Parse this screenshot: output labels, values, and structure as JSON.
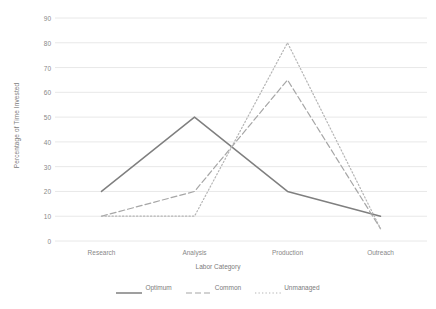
{
  "chart_data": {
    "type": "line",
    "title": "",
    "xlabel": "Labor Category",
    "ylabel": "Percentage of Time Invested",
    "categories": [
      "Research",
      "Analysis",
      "Production",
      "Outreach"
    ],
    "ylim": [
      0,
      90
    ],
    "ytick_labels": [
      "0",
      "10",
      "20",
      "30",
      "40",
      "50",
      "60",
      "70",
      "80",
      "90"
    ],
    "ytick_values": [
      0,
      10,
      20,
      30,
      40,
      50,
      60,
      70,
      80,
      90
    ],
    "grid": true,
    "grid_axis": "y",
    "legend_position": "bottom",
    "series": [
      {
        "name": "Optimum",
        "values": [
          20,
          50,
          20,
          10
        ],
        "style": "solid",
        "color": "#7f7f7f"
      },
      {
        "name": "Common",
        "values": [
          10,
          20,
          65,
          5
        ],
        "style": "dashed",
        "color": "#a6a6a6"
      },
      {
        "name": "Unmanaged",
        "values": [
          10,
          10,
          80,
          5
        ],
        "style": "dotted",
        "color": "#b5b5b5"
      }
    ]
  },
  "colors": {
    "grid": "#e8e8e8",
    "axis_text": "#888888",
    "title_text": "#7b7b7b",
    "background": "#ffffff"
  }
}
